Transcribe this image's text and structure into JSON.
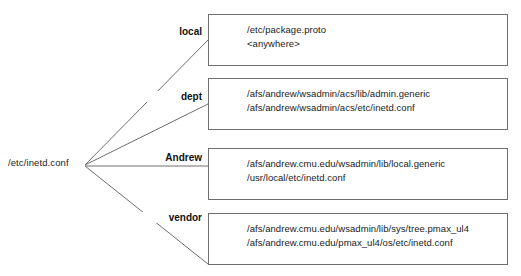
{
  "diagram": {
    "type": "tree",
    "root": {
      "label": "/etc/inetd.conf"
    },
    "branches": [
      {
        "label": "local",
        "lines": [
          "/etc/package.proto",
          "<anywhere>"
        ]
      },
      {
        "label": "dept",
        "lines": [
          "/afs/andrew/wsadmin/acs/lib/admin.generic",
          "/afs/andrew/wsadmin/acs/etc/inetd.conf"
        ]
      },
      {
        "label": "Andrew",
        "lines": [
          "/afs/andrew.cmu.edu/wsadmin/lib/local.generic",
          "/usr/local/etc/inetd.conf"
        ]
      },
      {
        "label": "vendor",
        "lines": [
          "/afs/andrew.cmu.edu/wsadmin/lib/sys/tree.pmax_ul4",
          "/afs/andrew.cmu.edu/pmax_ul4/os/etc/inetd.conf"
        ]
      }
    ],
    "colors": {
      "line": "#6e6e6e",
      "box_border": "#6e6e6e",
      "text": "#1a1a1a",
      "background": "#ffffff"
    }
  }
}
